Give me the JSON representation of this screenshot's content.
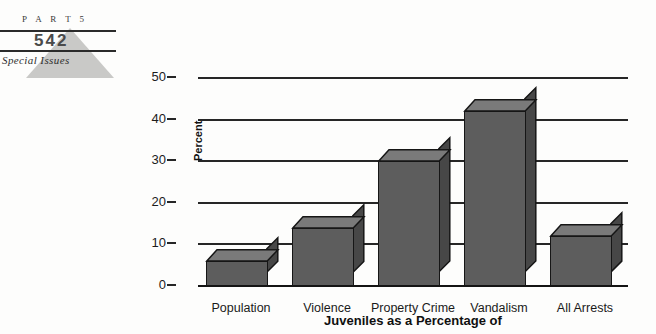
{
  "page_header": {
    "part_label": "P A R T   5",
    "page_number": "542",
    "section_label": "Special Issues"
  },
  "chart_data": {
    "type": "bar",
    "title": "Juveniles as a Percentage of",
    "xlabel": "Juveniles as a Percentage of",
    "ylabel": "Percent",
    "categories": [
      "Population",
      "Violence",
      "Property Crime",
      "Vandalism",
      "All Arrests"
    ],
    "values": [
      6,
      14,
      30,
      42,
      12
    ],
    "ylim": [
      0,
      50
    ],
    "yticks": [
      "0",
      "10",
      "20",
      "30",
      "40",
      "50"
    ],
    "grid": true,
    "legend": "none",
    "bar_style": "3d-isometric",
    "colors": {
      "bar_front": "#5d5d5d",
      "bar_top": "#7a7a7a",
      "bar_side": "#474747",
      "outline": "#161616",
      "gridline": "#262626",
      "background": "#fdfdfc"
    }
  }
}
